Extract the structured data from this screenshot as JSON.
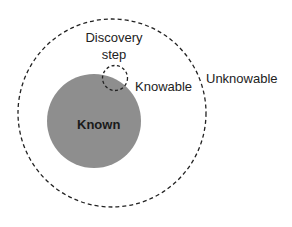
{
  "diagram": {
    "labels": {
      "discovery": "Discovery\nstep",
      "discovery_line1": "Discovery",
      "discovery_line2": "step",
      "knowable": "Knowable",
      "unknowable": "Unknowable",
      "known": "Known"
    },
    "colors": {
      "known_fill": "#8e8e8e",
      "dashed_stroke": "#222222",
      "text": "#222222"
    }
  }
}
